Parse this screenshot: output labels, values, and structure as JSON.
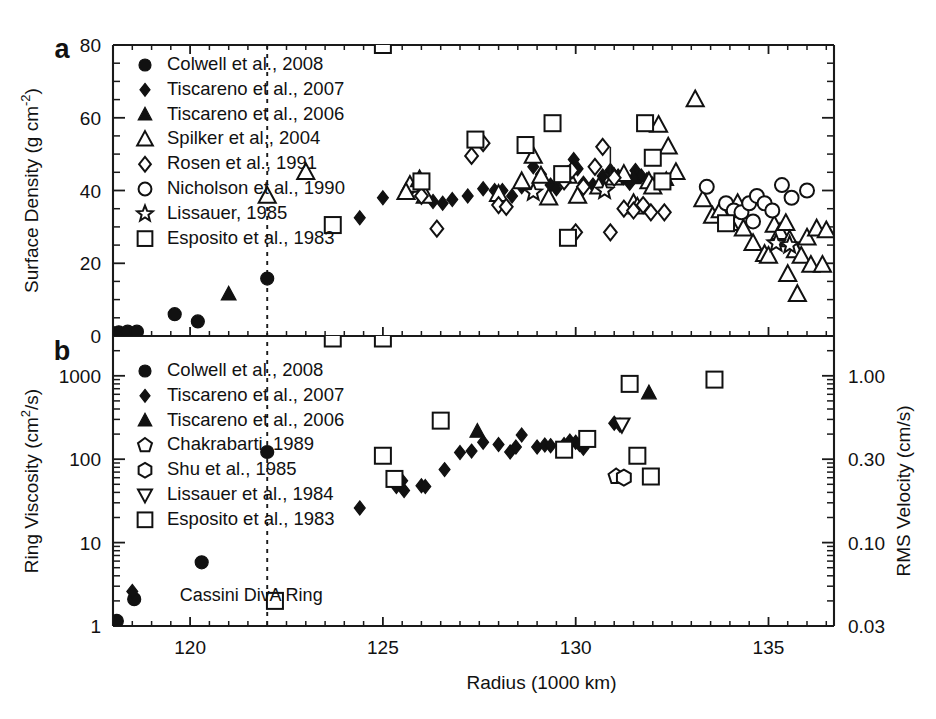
{
  "figure": {
    "background": "#ffffff",
    "ink_color": "#111111"
  },
  "panels": [
    {
      "letter": "a",
      "ylabel": "Surface Density (g cm",
      "ylabel_exp": "-2",
      "ylabel_close": ")",
      "ylabel_full": "Surface Density (g cm-2)",
      "yticks": [
        "0",
        "20",
        "40",
        "60",
        "80"
      ],
      "legend": [
        {
          "marker": "filled-circle",
          "label": "Colwell et al., 2008"
        },
        {
          "marker": "filled-diamond",
          "label": "Tiscareno et al., 2007"
        },
        {
          "marker": "filled-triangle",
          "label": "Tiscareno et al., 2006"
        },
        {
          "marker": "open-triangle",
          "label": "Spilker et al., 2004"
        },
        {
          "marker": "open-diamond",
          "label": "Rosen et al., 1991"
        },
        {
          "marker": "open-circle",
          "label": "Nicholson et al., 1990"
        },
        {
          "marker": "open-star",
          "label": "Lissauer, 1985"
        },
        {
          "marker": "open-square",
          "label": "Esposito et al., 1983"
        }
      ]
    },
    {
      "letter": "b",
      "ylabel": "Ring Viscosity (cm",
      "ylabel_exp": "2",
      "ylabel_close": "/s)",
      "ylabel_full": "Ring Viscosity (cm2/s)",
      "yticks": [
        "1",
        "10",
        "100",
        "1000"
      ],
      "ylabel_right": "RMS Velocity (cm/s)",
      "yticks_right": [
        "0.03",
        "0.10",
        "0.30",
        "1.00"
      ],
      "legend": [
        {
          "marker": "filled-circle",
          "label": "Colwell et al., 2008"
        },
        {
          "marker": "filled-diamond",
          "label": "Tiscareno et al., 2007"
        },
        {
          "marker": "filled-triangle",
          "label": "Tiscareno et al., 2006"
        },
        {
          "marker": "open-pentagon",
          "label": "Chakrabarti, 1989"
        },
        {
          "marker": "open-hexagon",
          "label": "Shu et al., 1985"
        },
        {
          "marker": "open-triangle-down",
          "label": "Lissauer et al., 1984"
        },
        {
          "marker": "open-square",
          "label": "Esposito et al., 1983"
        }
      ]
    }
  ],
  "xaxis": {
    "label": "Radius (1000 km)",
    "ticks": [
      "120",
      "125",
      "130",
      "135"
    ],
    "tick_values": [
      120,
      125,
      130,
      135
    ],
    "range": [
      117.6,
      136.7
    ]
  },
  "annotations": [
    {
      "name": "cassini-division-label",
      "text": "Cassini Div",
      "x": 120.9,
      "panel": "b"
    },
    {
      "name": "a-ring-label",
      "text": "A Ring",
      "x": 122.6,
      "panel": "b"
    }
  ],
  "divider": {
    "name": "ring-boundary-divider",
    "x": 122.0
  },
  "chart_data": {
    "type": "scatter",
    "title": "",
    "xlabel": "Radius (1000 km)",
    "xlim": [
      117.6,
      136.7
    ],
    "grid": false,
    "legend_position": "upper-left",
    "panels": [
      {
        "id": "a",
        "ylabel": "Surface Density (g cm^-2)",
        "ylim": [
          0,
          80
        ],
        "yscale": "linear",
        "yticks": [
          0,
          20,
          40,
          60,
          80
        ],
        "series": [
          {
            "name": "Colwell et al., 2008",
            "marker": "filled-circle",
            "points": [
              [
                117.75,
                1.0
              ],
              [
                117.95,
                1.0
              ],
              [
                118.15,
                1.0
              ],
              [
                118.38,
                1.2
              ],
              [
                118.62,
                1.2
              ],
              [
                119.6,
                6.0
              ],
              [
                120.2,
                4.0
              ],
              [
                122.0,
                15.8
              ]
            ]
          },
          {
            "name": "Tiscareno et al., 2007",
            "marker": "filled-diamond",
            "points": [
              [
                124.4,
                32.5
              ],
              [
                125.0,
                38.0
              ],
              [
                125.7,
                40.0
              ],
              [
                126.0,
                42.5
              ],
              [
                126.3,
                37.0
              ],
              [
                126.55,
                36.5
              ],
              [
                126.8,
                37.5
              ],
              [
                127.2,
                38.5
              ],
              [
                127.6,
                40.5
              ],
              [
                127.9,
                40.0
              ],
              [
                128.1,
                40.0
              ],
              [
                128.35,
                38.5
              ],
              [
                128.6,
                41.0
              ],
              [
                128.9,
                46.5
              ],
              [
                129.1,
                44.5
              ],
              [
                129.35,
                41.5
              ],
              [
                129.5,
                40.5
              ],
              [
                129.95,
                48.5
              ],
              [
                130.05,
                46.0
              ],
              [
                130.2,
                42.0
              ],
              [
                130.45,
                41.5
              ],
              [
                130.7,
                44.0
              ],
              [
                130.9,
                45.5
              ],
              [
                131.1,
                44.0
              ],
              [
                131.25,
                43.5
              ],
              [
                131.4,
                42.0
              ],
              [
                131.55,
                45.5
              ],
              [
                131.7,
                44.0
              ],
              [
                131.85,
                43.0
              ],
              [
                132.0,
                41.5
              ]
            ]
          },
          {
            "name": "Tiscareno et al., 2006",
            "marker": "filled-triangle",
            "points": [
              [
                121.0,
                11.5
              ],
              [
                131.5,
                43.5
              ],
              [
                132.35,
                43.0
              ]
            ]
          },
          {
            "name": "Spilker et al., 2004",
            "marker": "open-triangle",
            "points": [
              [
                122.0,
                38.5
              ],
              [
                123.0,
                45.0
              ],
              [
                125.7,
                41.5
              ],
              [
                125.95,
                43.0
              ],
              [
                125.6,
                39.5
              ],
              [
                126.1,
                38.5
              ],
              [
                128.0,
                39.0
              ],
              [
                128.6,
                42.5
              ],
              [
                128.9,
                49.5
              ],
              [
                129.1,
                44.0
              ],
              [
                129.3,
                38.0
              ],
              [
                129.8,
                44.0
              ],
              [
                130.05,
                38.5
              ],
              [
                130.6,
                41.0
              ],
              [
                131.0,
                43.5
              ],
              [
                131.25,
                44.5
              ],
              [
                131.5,
                36.5
              ],
              [
                131.6,
                35.5
              ],
              [
                131.9,
                42.5
              ],
              [
                132.0,
                41.0
              ],
              [
                132.15,
                58.0
              ],
              [
                132.4,
                52.0
              ],
              [
                132.6,
                45.0
              ],
              [
                133.1,
                65.0
              ],
              [
                133.3,
                37.5
              ],
              [
                133.55,
                33.0
              ],
              [
                133.75,
                34.5
              ],
              [
                134.0,
                31.0
              ],
              [
                134.2,
                36.5
              ],
              [
                134.35,
                29.5
              ],
              [
                134.6,
                25.5
              ],
              [
                134.9,
                22.5
              ],
              [
                135.0,
                22.0
              ],
              [
                135.15,
                30.5
              ],
              [
                135.3,
                28.5
              ],
              [
                135.45,
                31.0
              ],
              [
                135.55,
                26.5
              ],
              [
                135.7,
                23.5
              ],
              [
                135.85,
                22.0
              ],
              [
                136.0,
                27.0
              ],
              [
                136.1,
                19.5
              ],
              [
                136.25,
                29.5
              ],
              [
                136.4,
                19.5
              ],
              [
                135.5,
                17.0
              ],
              [
                135.75,
                11.5
              ],
              [
                136.5,
                29.0
              ]
            ]
          },
          {
            "name": "Rosen et al., 1991",
            "marker": "open-diamond",
            "points": [
              [
                126.0,
                38.5
              ],
              [
                126.4,
                29.5
              ],
              [
                127.3,
                49.5
              ],
              [
                127.6,
                53.0
              ],
              [
                128.0,
                36.0
              ],
              [
                128.2,
                35.5
              ],
              [
                129.7,
                42.5
              ],
              [
                129.9,
                45.5
              ],
              [
                130.2,
                41.0
              ],
              [
                130.5,
                46.5
              ],
              [
                130.7,
                52.0
              ],
              [
                131.0,
                43.5
              ],
              [
                131.25,
                35.0
              ],
              [
                131.5,
                34.5
              ],
              [
                131.75,
                36.0
              ],
              [
                131.95,
                34.0
              ],
              [
                132.3,
                34.0
              ],
              [
                130.0,
                28.5
              ],
              [
                130.9,
                28.5
              ]
            ]
          },
          {
            "name": "Nicholson et al., 1990",
            "marker": "open-circle",
            "points": [
              [
                133.4,
                41.0
              ],
              [
                133.9,
                36.5
              ],
              [
                134.1,
                34.5
              ],
              [
                134.3,
                34.0
              ],
              [
                134.5,
                36.5
              ],
              [
                134.7,
                38.5
              ],
              [
                134.9,
                36.5
              ],
              [
                135.1,
                34.5
              ],
              [
                135.35,
                41.5
              ],
              [
                135.6,
                38.0
              ],
              [
                136.0,
                40.0
              ],
              [
                134.6,
                31.5
              ]
            ]
          },
          {
            "name": "Lissauer, 1985",
            "marker": "open-star",
            "points": [
              [
                128.9,
                39.5
              ],
              [
                130.75,
                40.0
              ],
              [
                135.2,
                25.5
              ],
              [
                135.55,
                25.0
              ]
            ]
          },
          {
            "name": "Esposito et al., 1983",
            "marker": "open-square",
            "points": [
              [
                123.7,
                30.5
              ],
              [
                125.0,
                80.0
              ],
              [
                126.0,
                42.5
              ],
              [
                127.4,
                54.0
              ],
              [
                128.7,
                52.5
              ],
              [
                129.4,
                58.5
              ],
              [
                129.65,
                44.5
              ],
              [
                129.8,
                27.0
              ],
              [
                131.8,
                58.5
              ],
              [
                132.0,
                49.0
              ],
              [
                132.25,
                42.5
              ],
              [
                133.9,
                31.0
              ]
            ]
          }
        ]
      },
      {
        "id": "b",
        "ylabel": "Ring Viscosity (cm^2/s)",
        "ylabel_right": "RMS Velocity (cm/s)",
        "ylim": [
          1,
          3000
        ],
        "yscale": "log",
        "yticks": [
          1,
          10,
          100,
          1000
        ],
        "yticks_right": [
          0.03,
          0.1,
          0.3,
          1.0
        ],
        "series": [
          {
            "name": "Colwell et al., 2008",
            "marker": "filled-circle",
            "points": [
              [
                117.8,
                1.35
              ],
              [
                118.1,
                1.15
              ],
              [
                118.55,
                2.1
              ],
              [
                120.3,
                5.8
              ],
              [
                122.0,
                122.0
              ]
            ]
          },
          {
            "name": "Tiscareno et al., 2007",
            "marker": "filled-diamond",
            "points": [
              [
                118.5,
                2.6
              ],
              [
                124.4,
                26.0
              ],
              [
                125.35,
                47.0
              ],
              [
                125.5,
                55.0
              ],
              [
                125.55,
                42.0
              ],
              [
                126.0,
                48.0
              ],
              [
                126.1,
                47.0
              ],
              [
                126.6,
                75.0
              ],
              [
                127.0,
                120.0
              ],
              [
                127.3,
                125.0
              ],
              [
                127.6,
                160.0
              ],
              [
                128.0,
                150.0
              ],
              [
                128.3,
                122.0
              ],
              [
                128.45,
                140.0
              ],
              [
                128.6,
                195.0
              ],
              [
                129.0,
                140.0
              ],
              [
                129.2,
                148.0
              ],
              [
                129.35,
                145.0
              ],
              [
                129.7,
                150.0
              ],
              [
                129.85,
                165.0
              ],
              [
                130.0,
                160.0
              ],
              [
                130.1,
                150.0
              ],
              [
                130.2,
                135.0
              ],
              [
                131.0,
                270.0
              ],
              [
                131.15,
                255.0
              ]
            ]
          },
          {
            "name": "Tiscareno et al., 2006",
            "marker": "filled-triangle",
            "points": [
              [
                127.45,
                215.0
              ],
              [
                131.9,
                620.0
              ]
            ]
          },
          {
            "name": "Chakrabarti, 1989",
            "marker": "open-pentagon",
            "points": [
              [
                131.05,
                62.0
              ]
            ]
          },
          {
            "name": "Shu et al., 1985",
            "marker": "open-hexagon",
            "points": [
              [
                131.25,
                60.0
              ]
            ]
          },
          {
            "name": "Lissauer et al., 1984",
            "marker": "open-triangle-down",
            "points": [
              [
                131.2,
                260.0
              ]
            ]
          },
          {
            "name": "Esposito et al., 1983",
            "marker": "open-square",
            "points": [
              [
                122.2,
                2.0
              ],
              [
                123.7,
                2800.0
              ],
              [
                125.0,
                2800.0
              ],
              [
                125.0,
                110.0
              ],
              [
                125.3,
                58.0
              ],
              [
                126.5,
                290.0
              ],
              [
                129.7,
                130.0
              ],
              [
                130.3,
                175.0
              ],
              [
                131.4,
                800.0
              ],
              [
                131.6,
                110.0
              ],
              [
                131.95,
                62.0
              ],
              [
                133.6,
                900.0
              ]
            ]
          }
        ]
      }
    ]
  }
}
